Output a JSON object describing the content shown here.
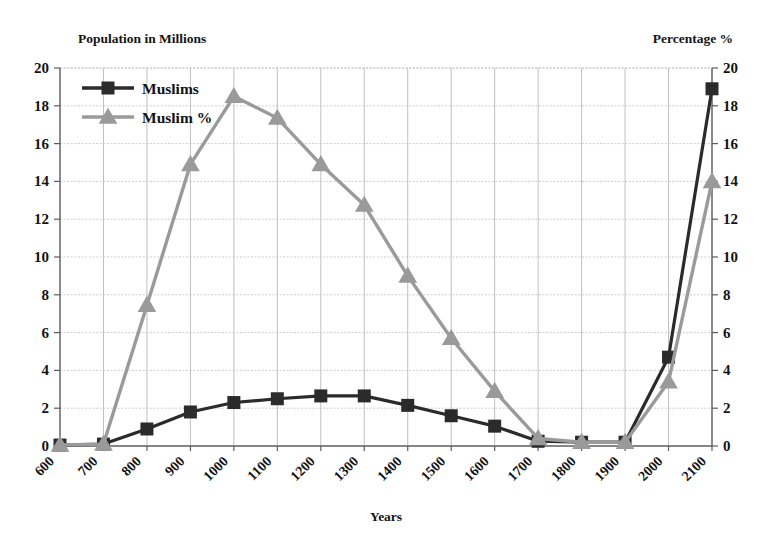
{
  "chart_data": {
    "type": "line",
    "title": "",
    "xlabel": "Years",
    "ylabel": "Population in Millions",
    "y2label": "Percentage %",
    "x": [
      600,
      700,
      800,
      900,
      1000,
      1100,
      1200,
      1300,
      1400,
      1500,
      1600,
      1700,
      1800,
      1900,
      2000,
      2100
    ],
    "categories": [
      "600",
      "700",
      "800",
      "900",
      "1000",
      "1100",
      "1200",
      "1300",
      "1400",
      "1500",
      "1600",
      "1700",
      "1800",
      "1900",
      "2000",
      "2100"
    ],
    "ylim": [
      0,
      20
    ],
    "y2lim": [
      0,
      20
    ],
    "yticks": [
      0,
      2,
      4,
      6,
      8,
      10,
      12,
      14,
      16,
      18,
      20
    ],
    "y2ticks": [
      0,
      2,
      4,
      6,
      8,
      10,
      12,
      14,
      16,
      18,
      20
    ],
    "grid": "both",
    "legend_position": "top-left",
    "series": [
      {
        "name": "Muslims",
        "axis": "left",
        "marker": "square",
        "color": "#2b2b2b",
        "values": [
          0.05,
          0.1,
          0.9,
          1.8,
          2.3,
          2.5,
          2.65,
          2.65,
          2.15,
          1.6,
          1.05,
          0.25,
          0.2,
          0.2,
          4.7,
          18.9
        ]
      },
      {
        "name": "Muslim %",
        "axis": "right",
        "marker": "triangle",
        "color": "#9a9a9a",
        "values": [
          0.05,
          0.1,
          7.45,
          14.9,
          18.5,
          17.35,
          14.9,
          12.75,
          9.0,
          5.7,
          2.9,
          0.4,
          0.2,
          0.2,
          3.4,
          14.0
        ]
      }
    ]
  },
  "legend": {
    "items": [
      {
        "label": "Muslims"
      },
      {
        "label": "Muslim %"
      }
    ]
  },
  "labels": {
    "left_axis_title": "Population in Millions",
    "right_axis_title": "Percentage %",
    "x_axis_title": "Years"
  }
}
